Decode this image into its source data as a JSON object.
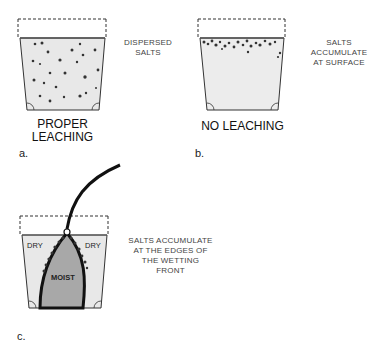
{
  "panels": [
    {
      "id": "a",
      "letter": "a.",
      "caption_line1": "PROPER",
      "caption_line2": "LEACHING",
      "note_line1": "DISPERSED",
      "note_line2": "SALTS"
    },
    {
      "id": "b",
      "letter": "b.",
      "caption": "NO LEACHING",
      "note_line1": "SALTS",
      "note_line2": "ACCUMULATE",
      "note_line3": "AT SURFACE"
    },
    {
      "id": "c",
      "letter": "c.",
      "label_dry_left": "DRY",
      "label_dry_right": "DRY",
      "label_moist": "MOIST",
      "note_line1": "SALTS ACCUMULATE",
      "note_line2": "AT THE EDGES OF",
      "note_line3": "THE WETTING FRONT"
    }
  ],
  "colors": {
    "soil": "#e6e6e6",
    "moist": "#a8a8a8",
    "line": "#222222"
  }
}
